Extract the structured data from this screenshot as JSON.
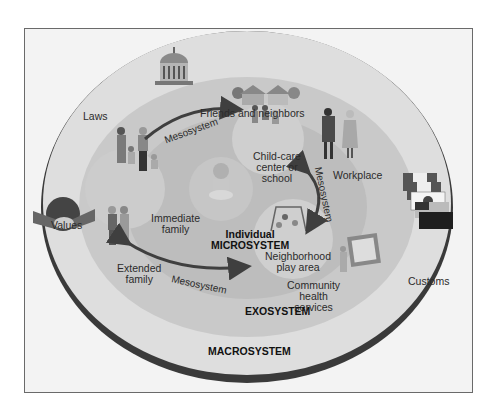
{
  "diagram": {
    "type": "ecological-systems-model",
    "colors": {
      "page_bg": "#ffffff",
      "frame_bg": "#f3f3f3",
      "frame_border": "#6a6a6a",
      "macrosystem_fill": "#dedede",
      "macrosystem_edge": "#3a3a3a",
      "exosystem_fill": "#c9c9c9",
      "microsystem_fill": "#bdbdbd",
      "inner_blob_fill": "#d0d0d0",
      "arrow": "#3f3f3f",
      "text": "#2b2b2b"
    },
    "layers": {
      "macrosystem": "MACROSYSTEM",
      "exosystem": "EXOSYSTEM",
      "microsystem_line1": "Individual",
      "microsystem_line2": "MICROSYSTEM"
    },
    "macro_items": {
      "laws": "Laws",
      "values": "Values",
      "customs": "Customs"
    },
    "exo_items": {
      "friends": "Friends and neighbors",
      "workplace": "Workplace",
      "extended_line1": "Extended",
      "extended_line2": "family",
      "community_line1": "Community",
      "community_line2": "health",
      "community_line3": "services"
    },
    "micro_items": {
      "family_line1": "Immediate",
      "family_line2": "family",
      "childcare_line1": "Child-care",
      "childcare_line2": "center or",
      "childcare_line3": "school",
      "play_line1": "Neighborhood",
      "play_line2": "play area"
    },
    "arrows": {
      "top": "Mesosystem",
      "right": "Mesosystem",
      "bottom": "Mesosystem"
    }
  }
}
